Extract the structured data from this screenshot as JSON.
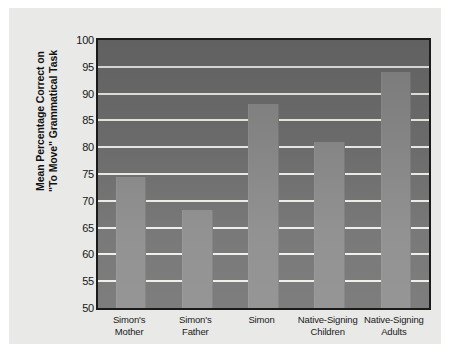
{
  "figure": {
    "caption_mark": "",
    "background_color": "#e9e9e7",
    "plot_background_color": "#6f6f6f",
    "bar_color": "#8a8a8a",
    "gridline_color": "#efefe9",
    "axis_border_color": "#1b1b1b"
  },
  "chart_data": {
    "type": "bar",
    "title": "",
    "xlabel": "",
    "ylabel": "Mean Percentage Correct on\n\"To Move\" Grammatical Task",
    "categories": [
      "Simon's\nMother",
      "Simon's\nFather",
      "Simon",
      "Native-Signing\nChildren",
      "Native-Signing\nAdults"
    ],
    "values": [
      74.5,
      68.3,
      88.0,
      81.0,
      94.0
    ],
    "ylim": [
      50,
      100
    ],
    "yticks": [
      50,
      55,
      60,
      65,
      70,
      75,
      80,
      85,
      90,
      95,
      100
    ],
    "ytick_labels": [
      "50",
      "55",
      "60",
      "65",
      "70",
      "75",
      "80",
      "85",
      "90",
      "95",
      "100"
    ],
    "grid": true,
    "grid_axis": "y",
    "legend": null,
    "legend_position": "none"
  }
}
